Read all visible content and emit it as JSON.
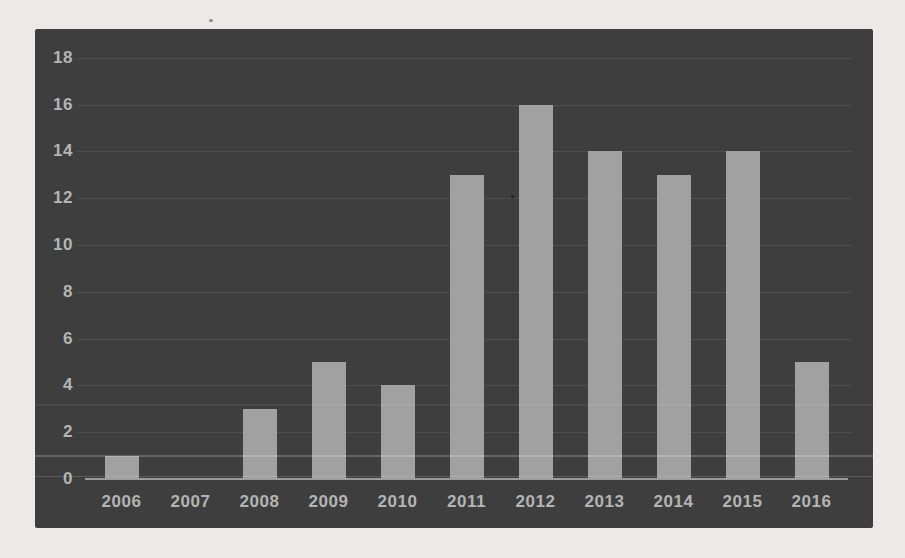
{
  "chart_data": {
    "type": "bar",
    "categories": [
      "2006",
      "2007",
      "2008",
      "2009",
      "2010",
      "2011",
      "2012",
      "2013",
      "2014",
      "2015",
      "2016"
    ],
    "values": [
      1,
      0,
      3,
      5,
      4,
      13,
      16,
      14,
      13,
      14,
      5
    ],
    "yticks": [
      0,
      2,
      4,
      6,
      8,
      10,
      12,
      14,
      16,
      18
    ],
    "ylim": [
      0,
      18
    ],
    "title": "",
    "xlabel": "",
    "ylabel": "",
    "grid": true,
    "legend": false
  },
  "colors": {
    "page_background": "#eceae6",
    "plot_background": "#3e3e3e",
    "bar_fill": "#a1a1a1",
    "gridline": "#4f4f4f",
    "axis_line": "#9b9b9b",
    "tick_label": "#b4b4b4"
  }
}
